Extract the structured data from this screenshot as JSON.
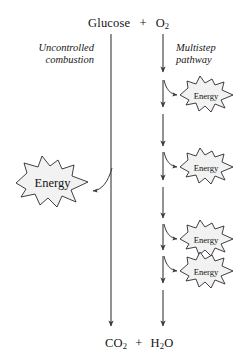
{
  "diagram": {
    "top_reactants": {
      "molecule_1": "Glucose",
      "operator": "+",
      "molecule_2": "O",
      "molecule_2_sub": "2"
    },
    "bottom_products": {
      "molecule_1": "CO",
      "molecule_1_sub": "2",
      "operator": "+",
      "molecule_2": "H",
      "molecule_2_sub": "2",
      "molecule_2_tail": "O"
    },
    "left_pathway": {
      "label_line_1": "Uncontrolled",
      "label_line_2": "combustion",
      "energy_label": "Energy"
    },
    "right_pathway": {
      "label_line_1": "Multistep",
      "label_line_2": "pathway",
      "energy_steps": [
        {
          "label": "Energy"
        },
        {
          "label": "Energy"
        },
        {
          "label": "Energy"
        },
        {
          "label": "Energy"
        }
      ]
    },
    "colors": {
      "background": "#ffffff",
      "stroke": "#3a3a3a",
      "text": "#141414",
      "burst_fill": "#f2f2f2",
      "burst_stroke": "#2b2b2b"
    }
  }
}
